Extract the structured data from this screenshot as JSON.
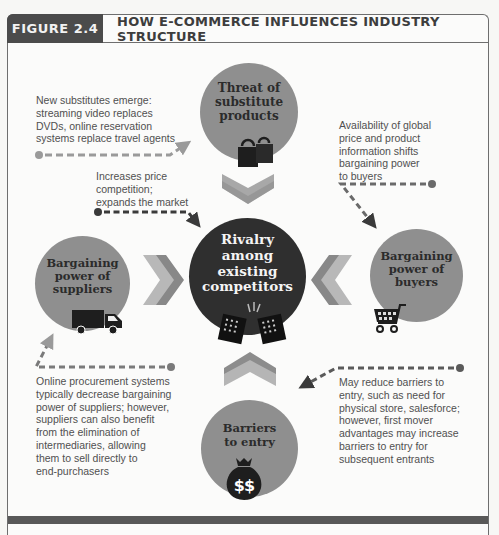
{
  "header": {
    "figure_label": "FIGURE 2.4",
    "title": "HOW E-COMMERCE INFLUENCES INDUSTRY STRUCTURE"
  },
  "colors": {
    "header_label_bg": "#4b4b4b",
    "circle_gray": "#8f8f8f",
    "circle_dark": "#2f2f2f",
    "chevron_light": "#b5b5b5",
    "chevron_dark": "#8a8a8a",
    "connector": "#5a5a5a"
  },
  "forces": {
    "top": {
      "label": "Threat of substitute products",
      "lines": [
        "Threat of",
        "substitute",
        "products"
      ],
      "icon": "shopping-bags-icon"
    },
    "left": {
      "label": "Bargaining power of suppliers",
      "lines": [
        "Bargaining",
        "power of",
        "suppliers"
      ],
      "icon": "delivery-truck-icon"
    },
    "center": {
      "label": "Rivalry among existing competitors",
      "lines": [
        "Rivalry",
        "among",
        "existing",
        "competitors"
      ],
      "icon": "competing-buildings-icon"
    },
    "right": {
      "label": "Bargaining power of buyers",
      "lines": [
        "Bargaining",
        "power of",
        "buyers"
      ],
      "icon": "shopping-cart-icon"
    },
    "bottom": {
      "label": "Barriers to entry",
      "lines": [
        "Barriers",
        "to entry"
      ],
      "icon": "money-bag-icon"
    }
  },
  "notes": {
    "substitutes": [
      "New substitutes emerge:",
      "streaming video replaces",
      "DVDs, online reservation",
      "systems replace travel agents"
    ],
    "rivalry": [
      "Increases price",
      "competition;",
      "expands the market"
    ],
    "buyers": [
      "Availability of global",
      "price and product",
      "information shifts",
      "bargaining power",
      "to buyers"
    ],
    "suppliers": [
      "Online procurement systems",
      "typically decrease bargaining",
      "power of suppliers; however,",
      "suppliers can also benefit",
      "from the elimination of",
      "intermediaries, allowing",
      "them to sell directly to",
      "end-purchasers"
    ],
    "barriers": [
      "May reduce barriers to",
      "entry, such as need for",
      "physical store, salesforce;",
      "however, first mover",
      "advantages may increase",
      "barriers to entry for",
      "subsequent entrants"
    ]
  },
  "money_bag_text": "$$"
}
